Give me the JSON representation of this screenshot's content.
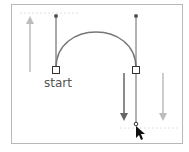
{
  "diagram": {
    "label_start": "start",
    "colors": {
      "frame": "#b8b8b8",
      "curve": "#777777",
      "handle": "#555555",
      "arrow_dark": "#666666",
      "arrow_light": "#bdbdbd",
      "guide": "#e2e2e2",
      "text": "#555555",
      "cursor": "#111111"
    }
  }
}
